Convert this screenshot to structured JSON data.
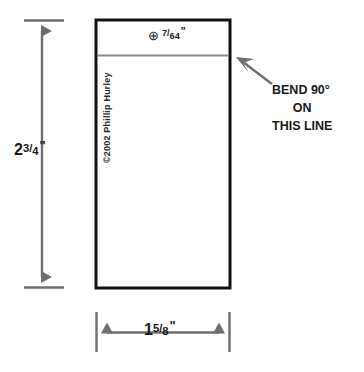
{
  "drawing": {
    "title": "Sheet metal bracket flat pattern",
    "background_color": "#ffffff",
    "outline_color": "#111111",
    "bend_line_color": "#8a8a8a",
    "dimension_color": "#6e6e6e",
    "text_color": "#1a1a1a"
  },
  "part": {
    "outline_name": "part-outline",
    "bend_line_name": "bend-line"
  },
  "hole_callout": {
    "symbol": "⊕",
    "symbol_name": "hole-center-crosshair-icon",
    "numerator": "7",
    "slash": "/",
    "denominator": "64",
    "unit": "\"",
    "full_text": "⊕ 7/64\""
  },
  "height_dimension": {
    "whole": "2",
    "numerator": "3",
    "slash": "/",
    "denominator": "4",
    "unit": "\"",
    "full_text": "2 3/4\""
  },
  "width_dimension": {
    "whole": "1",
    "numerator": "5",
    "slash": "/",
    "denominator": "8",
    "unit": "\"",
    "full_text": "1 5/8\""
  },
  "copyright": {
    "text": "©2002 Phillip Hurley"
  },
  "bend_note": {
    "line1": "BEND 90°",
    "line2": "ON",
    "line3": "THIS LINE",
    "full_text": "BEND 90° ON THIS LINE"
  }
}
